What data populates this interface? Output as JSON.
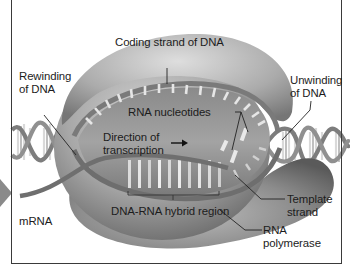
{
  "figure": {
    "labels": {
      "coding_strand": "Coding strand of DNA",
      "rewinding_line1": "Rewinding",
      "rewinding_line2": "of DNA",
      "unwinding_line1": "Unwinding",
      "unwinding_line2": "of DNA",
      "rna_nucleotides": "RNA nucleotides",
      "direction_line1": "Direction of",
      "direction_line2": "transcription",
      "hybrid_region": "DNA-RNA hybrid region",
      "mrna": "mRNA",
      "template_line1": "Template",
      "template_line2": "strand",
      "polymerase_line1": "RNA",
      "polymerase_line2": "polymerase"
    },
    "colors": {
      "enzyme_light": "#c9c9c9",
      "enzyme_mid": "#9a9a9a",
      "enzyme_dark": "#5e5e5e",
      "strand": "#6b6b6b",
      "frame": "#3a3a3a",
      "side_arrow": "#8a8a8a",
      "text": "#1c1c1c"
    }
  }
}
